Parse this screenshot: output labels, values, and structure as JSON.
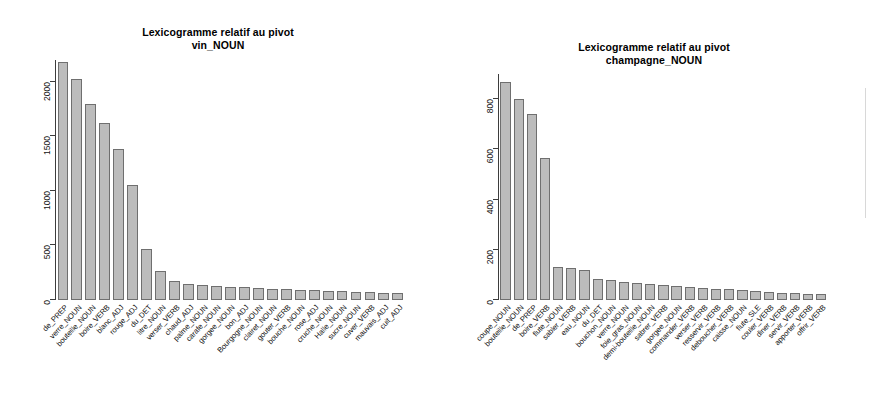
{
  "page": {
    "background": "#ffffff",
    "width": 872,
    "height": 420
  },
  "charts": [
    {
      "id": "lexicogramme-vin",
      "title_line1": "Lexicogramme relatif au pivot",
      "title_line2": "vin_NOUN"
    },
    {
      "id": "lexicogramme-champagne",
      "title_line1": "Lexicogramme relatif au pivot",
      "title_line2": "champagne_NOUN"
    }
  ],
  "chart_data": [
    {
      "type": "bar",
      "title": "Lexicogramme relatif au pivot\nvin_NOUN",
      "xlabel": "",
      "ylabel": "",
      "ylim": [
        0,
        2200
      ],
      "yticks": [
        0,
        500,
        1000,
        1500,
        2000
      ],
      "ytick_labels": [
        "0",
        "500",
        "1000",
        "1500",
        "2000"
      ],
      "grid": false,
      "legend": "none",
      "bar_color": "#bcbcbc",
      "bar_border": "#6f6f6f",
      "categories": [
        "de_PREP",
        "verre_NOUN",
        "bouteille_NOUN",
        "boire_VERB",
        "blanc_ADJ",
        "rouge_ADJ",
        "du_DET",
        "litre_NOUN",
        "verser_VERB",
        "chaud_ADJ",
        "palme_NOUN",
        "carafe_NOUN",
        "gorgee_NOUN",
        "bon_ADJ",
        "Bourgogne_NOUN",
        "clairet_NOUN",
        "gouter_VERB",
        "bouche_NOUN",
        "rose_ADJ",
        "cruche_NOUN",
        "Halle_NOUN",
        "sucre_NOUN",
        "cuver_VERB",
        "mauvais_ADJ",
        "cuit_ADJ"
      ],
      "values": [
        2180,
        2030,
        1800,
        1620,
        1380,
        1050,
        470,
        270,
        170,
        150,
        135,
        130,
        120,
        115,
        110,
        105,
        100,
        95,
        90,
        85,
        80,
        78,
        72,
        68,
        62
      ]
    },
    {
      "type": "bar",
      "title": "Lexicogramme relatif au pivot\nchampagne_NOUN",
      "xlabel": "",
      "ylabel": "",
      "ylim": [
        0,
        900
      ],
      "yticks": [
        0,
        200,
        400,
        600,
        800
      ],
      "ytick_labels": [
        "0",
        "200",
        "400",
        "600",
        "800"
      ],
      "grid": false,
      "legend": "none",
      "bar_color": "#bcbcbc",
      "bar_border": "#6f6f6f",
      "categories": [
        "coupe_NOUN",
        "bouteille_NOUN",
        "de_PREP",
        "boire_VERB",
        "flute_NOUN",
        "sabler_VERB",
        "eau_NOUN",
        "du_DET",
        "bouchon_NOUN",
        "verre_NOUN",
        "foie_gras_NOUN",
        "demi-bouteille_NOUN",
        "sabrer_VERB",
        "gorgee_NOUN",
        "commander_VERB",
        "verser_VERB",
        "resservir_VERB",
        "deboucher_VERB",
        "caisse_NOUN",
        "flute_SLE",
        "couler_VERB",
        "diner_VERB",
        "servir_VERB",
        "apporter_VERB",
        "offrir_VERB"
      ],
      "values": [
        870,
        800,
        740,
        565,
        130,
        128,
        120,
        85,
        78,
        72,
        68,
        64,
        60,
        56,
        52,
        48,
        44,
        42,
        38,
        34,
        30,
        28,
        26,
        24,
        22
      ]
    }
  ]
}
